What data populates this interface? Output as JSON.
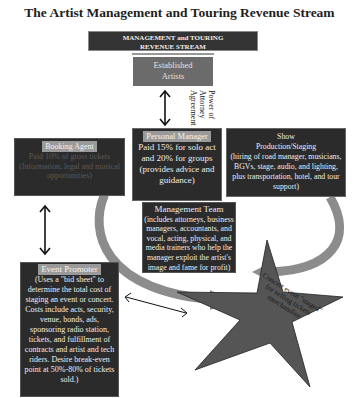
{
  "title": "The Artist Management and Touring Revenue Stream",
  "header": {
    "line1": "MANAGEMENT and TOURING",
    "line2": "REVENUE STREAM"
  },
  "artists": {
    "line1": "Established",
    "line2": "Artists"
  },
  "connector": {
    "label": "Power of Attorney Agreement",
    "icon": "double-arrow-vertical"
  },
  "booking_agent": {
    "label": "Booking Agent",
    "body": "Paid 10% of gross tickets (Information, legal and musical opportunities)"
  },
  "personal_manager": {
    "label": "Personal Manager",
    "body": "Paid 15% for solo act and 20% for groups (provides advice and guidance)"
  },
  "show": {
    "title": "Show",
    "subtitle": "Production/Staging",
    "body": "(hiring of road manager, musicians, BGVs, stage, audio, and lighting, plus transportation, hotel, and tour support)"
  },
  "management_team": {
    "title": "Management Team",
    "body": "(includes attorneys, business managers, accountants, and vocal, acting, physical, and media trainers who help the manager exploit the artist's image and fame for profit)"
  },
  "event_promoter": {
    "label": "Event Promoter",
    "body": "(Uses a \"bid sheet\" to determine the total cost of staging an event or concert. Costs include acts, security, venue, bonds, ads, sponsoring radio station, tickets, and fulfillment of contracts and artist and tech riders. Desire break-even point at 50%-80% of tickets sold.)"
  },
  "star": {
    "text": "Concert event \"staged\" for selling tickets merchandise"
  },
  "colors": {
    "box": "#2b2b2b",
    "label_bg": "#9a9a9a",
    "artists_bg": "#6b6b6b",
    "arc": "#8c8c8c",
    "star": "#555555"
  }
}
